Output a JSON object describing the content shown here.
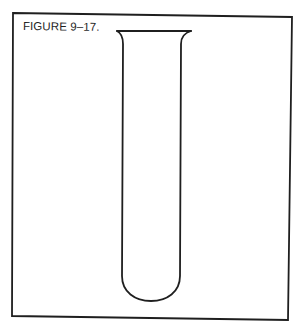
{
  "figure": {
    "label": "FIGURE 9–17.",
    "stroke_color": "#1f1f1f",
    "background_color": "#ffffff"
  },
  "frame": {
    "corners": {
      "top_left": [
        13,
        13
      ],
      "top_right": [
        292,
        17
      ],
      "bottom_right": [
        288,
        320
      ],
      "bottom_left": [
        12,
        316
      ]
    }
  },
  "test_tube": {
    "rim": {
      "left": [
        117,
        31
      ],
      "right": [
        191,
        31
      ]
    },
    "left_wall_x": 123,
    "right_wall_x": 180,
    "bottom_y": 301,
    "empty": true
  }
}
